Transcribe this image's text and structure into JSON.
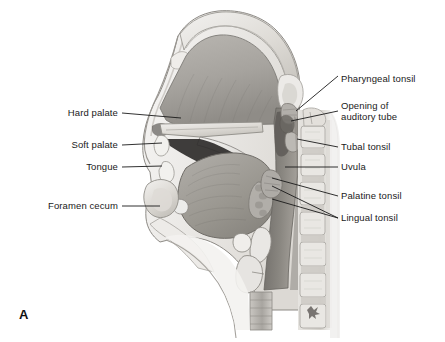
{
  "figure": {
    "panel_letter": "A",
    "caption_type": "sagittal-section-of-head-and-neck-showing-tonsils",
    "background_color": "#ffffff",
    "text_color": "#1a1a1a",
    "leader_color": "#1a1a1a"
  },
  "labels_left": [
    {
      "id": "hard-palate",
      "text": "Hard palate",
      "text_right_x": 118,
      "text_y": 113,
      "leader": {
        "x1": 122,
        "y1": 113,
        "x2": 181,
        "y2": 118
      }
    },
    {
      "id": "soft-palate",
      "text": "Soft palate",
      "text_right_x": 118,
      "text_y": 145,
      "leader": {
        "x1": 122,
        "y1": 145,
        "x2": 162,
        "y2": 143
      }
    },
    {
      "id": "tongue",
      "text": "Tongue",
      "text_right_x": 118,
      "text_y": 167,
      "leader": {
        "x1": 122,
        "y1": 167,
        "x2": 162,
        "y2": 166
      }
    },
    {
      "id": "foramen-cecum",
      "text": "Foramen cecum",
      "text_right_x": 118,
      "text_y": 206,
      "leader": {
        "x1": 122,
        "y1": 206,
        "x2": 160,
        "y2": 206
      }
    }
  ],
  "labels_right": [
    {
      "id": "pharyngeal-tonsil",
      "text": "Pharyngeal tonsil",
      "text_left_x": 341,
      "text_y": 79,
      "leader": {
        "x1": 338,
        "y1": 76,
        "x2": 296,
        "y2": 111
      }
    },
    {
      "id": "opening-of-auditory-tube",
      "text_line1": "Opening of",
      "text_line2": "auditory tube",
      "text_left_x": 341,
      "text_y": 106,
      "leader": {
        "x1": 338,
        "y1": 111,
        "x2": 291,
        "y2": 121
      }
    },
    {
      "id": "tubal-tonsil",
      "text": "Tubal tonsil",
      "text_left_x": 341,
      "text_y": 147,
      "leader": {
        "x1": 338,
        "y1": 147,
        "x2": 297,
        "y2": 139
      }
    },
    {
      "id": "uvula",
      "text": "Uvula",
      "text_left_x": 341,
      "text_y": 167,
      "leader": {
        "x1": 338,
        "y1": 167,
        "x2": 285,
        "y2": 167
      }
    },
    {
      "id": "palatine-tonsil",
      "text": "Palatine tonsil",
      "text_left_x": 341,
      "text_y": 196,
      "leader": {
        "x1": 338,
        "y1": 196,
        "x2": 272,
        "y2": 178
      }
    },
    {
      "id": "lingual-tonsil",
      "text": "Lingual tonsil",
      "text_left_x": 341,
      "text_y": 218,
      "leader_a": {
        "x1": 338,
        "y1": 218,
        "x2": 272,
        "y2": 186
      },
      "leader_b": {
        "x1": 338,
        "y1": 218,
        "x2": 272,
        "y2": 199
      }
    }
  ],
  "illustration": {
    "type": "midsagittal-section-grayscale-drawing",
    "regions": [
      "nasal-cavity",
      "hard-palate",
      "soft-palate",
      "oral-cavity",
      "tongue",
      "nasopharynx",
      "oropharynx",
      "laryngopharynx",
      "epiglottis",
      "hyoid-bone",
      "larynx",
      "trachea",
      "cervical-vertebrae",
      "mandible",
      "frontal-sinus",
      "sphenoid-sinus",
      "spinal-cord"
    ],
    "palette": {
      "outline": "#555555",
      "bone_light": "#e8e6e2",
      "bone_mid": "#cfccc6",
      "mucosa_light": "#bfbcb7",
      "mucosa_mid": "#a5a29c",
      "cavity_dark": "#8e8b86",
      "tongue": "#9b9893",
      "airway_shadow": "#6f6c68",
      "deep_shadow": "#2a2a2a",
      "highlight": "#f4f3f1"
    }
  }
}
